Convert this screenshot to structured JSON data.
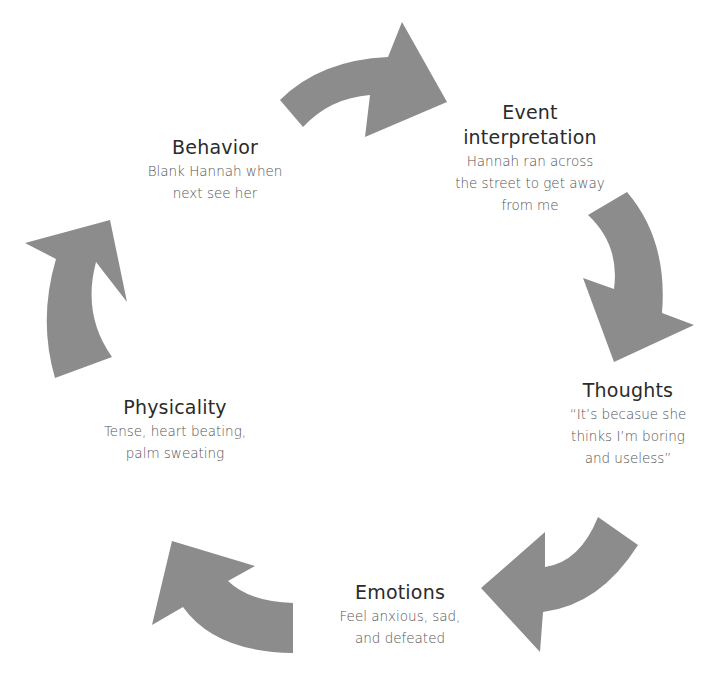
{
  "diagram": {
    "type": "cycle",
    "arrow_color": "#8c8c8c",
    "nodes": [
      {
        "id": "event",
        "title": "Event interpretation",
        "title_lines": [
          "Event",
          "interpretation"
        ],
        "desc_lines": [
          "Hannah ran across",
          "the street to get away",
          "from me"
        ]
      },
      {
        "id": "thoughts",
        "title": "Thoughts",
        "desc_lines": [
          "“It’s becasue she",
          "thinks I’m boring",
          "and useless”"
        ]
      },
      {
        "id": "emotions",
        "title": "Emotions",
        "desc_lines": [
          "Feel anxious, sad,",
          "and defeated"
        ]
      },
      {
        "id": "physicality",
        "title": "Physicality",
        "desc_lines": [
          "Tense, heart beating,",
          "palm sweating"
        ]
      },
      {
        "id": "behavior",
        "title": "Behavior",
        "desc_lines": [
          "Blank Hannah when",
          "next see her"
        ]
      }
    ],
    "flow": [
      "behavior",
      "event",
      "thoughts",
      "emotions",
      "physicality",
      "behavior"
    ]
  }
}
